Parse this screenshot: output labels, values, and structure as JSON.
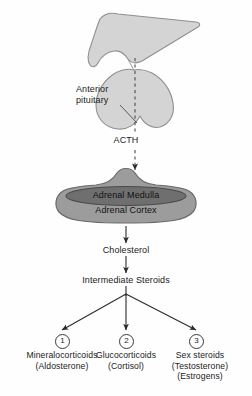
{
  "figure": {
    "colors": {
      "brain_fill": "#d4d4d4",
      "brain_stroke": "#8f8f8f",
      "cortex_fill": "#9c9c9c",
      "cortex_stroke": "#6a6a6a",
      "medulla_fill": "#6f6f6f",
      "medulla_stroke": "#4a4a4a",
      "arrow": "#2b2b2b",
      "text": "#1b1b1b",
      "background": "#fefefe"
    }
  },
  "anatomy": {
    "hypothalamus_name": "hypothalamus",
    "pituitary_label_line1": "Anterior",
    "pituitary_label_line2": "pituitary",
    "adrenal_medulla": "Adrenal Medulla",
    "adrenal_cortex": "Adrenal Cortex"
  },
  "hormones": {
    "acth": "ACTH",
    "cholesterol": "Cholesterol",
    "intermediate_steroids": "Intermediate Steroids"
  },
  "products": [
    {
      "number": "1",
      "circle_glyph": "①",
      "name": "Mineralocorticoids",
      "examples": [
        "(Aldosterone)"
      ]
    },
    {
      "number": "2",
      "circle_glyph": "②",
      "name": "Glucocorticoids",
      "examples": [
        "(Cortisol)"
      ]
    },
    {
      "number": "3",
      "circle_glyph": "③",
      "name": "Sex steroids",
      "examples": [
        "(Testosterone)",
        "(Estrogens)"
      ]
    }
  ]
}
